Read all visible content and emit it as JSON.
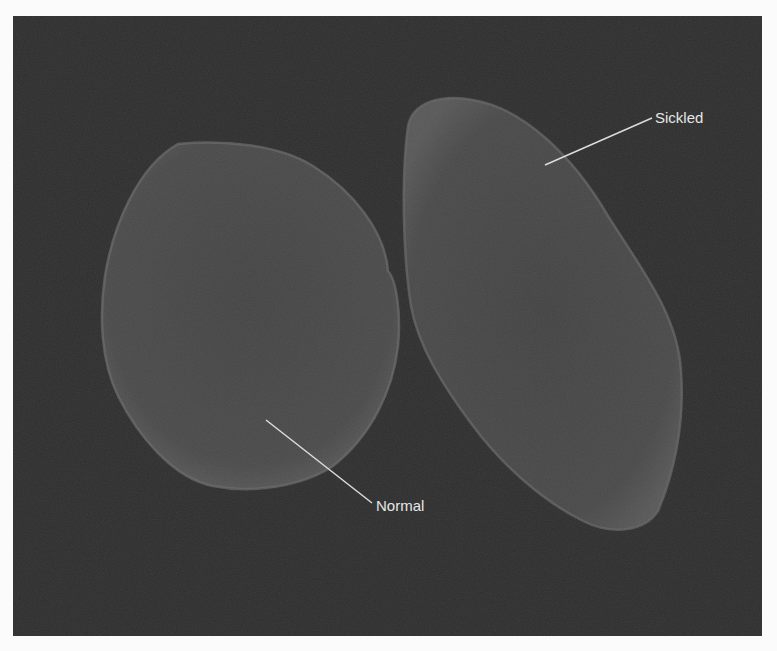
{
  "figure": {
    "background_color": "#2e2e2e",
    "cell_fill_color": "#4b4b4b",
    "cell_rim_color": "#6e6e6e",
    "label_color": "#e6e6e6"
  },
  "annotations": {
    "sickled": {
      "label": "Sickled"
    },
    "normal": {
      "label": "Normal"
    }
  }
}
